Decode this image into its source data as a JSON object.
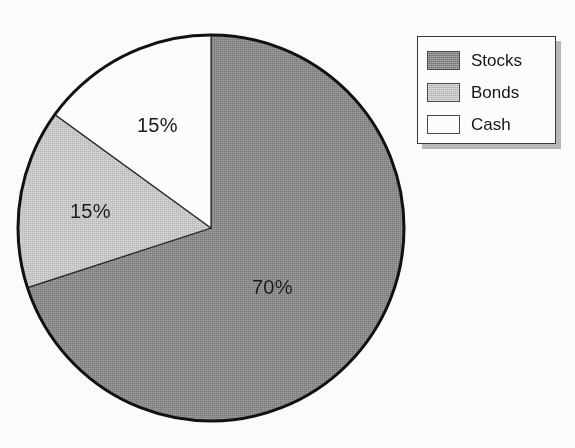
{
  "chart_data": {
    "type": "pie",
    "title": "",
    "subtitle": "",
    "categories": [
      "Stocks",
      "Bonds",
      "Cash"
    ],
    "values": [
      70,
      15,
      15
    ],
    "value_unit": "%",
    "start_angle_deg": 0,
    "direction": "clockwise",
    "slices": [
      {
        "name": "Stocks",
        "value": 70,
        "label": "70%",
        "color": "#8d8d8d",
        "fill_style": "dithered-dark-gray",
        "start_angle_deg": 0,
        "end_angle_deg": 252,
        "label_x": 252,
        "label_y": 276
      },
      {
        "name": "Bonds",
        "value": 15,
        "label": "15%",
        "color": "#c9c9c9",
        "fill_style": "dithered-light-gray",
        "start_angle_deg": 252,
        "end_angle_deg": 306,
        "label_x": 70,
        "label_y": 200
      },
      {
        "name": "Cash",
        "value": 15,
        "label": "15%",
        "color": "#ffffff",
        "fill_style": "solid-white",
        "start_angle_deg": 306,
        "end_angle_deg": 360,
        "label_x": 137,
        "label_y": 114
      }
    ],
    "legend": {
      "position": "top-right",
      "has_border": true,
      "has_drop_shadow": true,
      "entries": [
        {
          "label": "Stocks",
          "color": "#8d8d8d"
        },
        {
          "label": "Bonds",
          "color": "#c9c9c9"
        },
        {
          "label": "Cash",
          "color": "#ffffff"
        }
      ]
    },
    "geometry": {
      "center_x": 211,
      "center_y": 228,
      "radius": 194,
      "outline_color": "#111111",
      "outline_width": 3
    },
    "grid": false,
    "xlabel": "",
    "ylabel": ""
  },
  "colors": {
    "background": "#fdfdfd",
    "outline": "#111111",
    "text": "#1a1a1a",
    "stocks": "#8d8d8d",
    "bonds": "#c9c9c9",
    "cash": "#ffffff",
    "legend_border": "#3a3a3a",
    "legend_shadow": "#b9b9b9"
  }
}
